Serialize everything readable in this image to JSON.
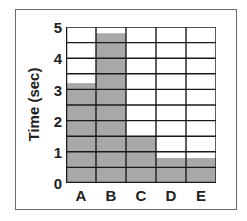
{
  "chart_data": {
    "type": "bar",
    "title": "",
    "xlabel": "",
    "ylabel": "Time (sec)",
    "categories": [
      "A",
      "B",
      "C",
      "D",
      "E"
    ],
    "values": [
      3.2,
      4.8,
      1.5,
      0.8,
      0.8
    ],
    "ylim": [
      0,
      5
    ],
    "yticks": [
      "0",
      "1",
      "2",
      "3",
      "4",
      "5"
    ],
    "grid": true,
    "grid_step": 0.5,
    "bar_color": "#a8a8a8",
    "grid_color": "#1a1a1a"
  }
}
